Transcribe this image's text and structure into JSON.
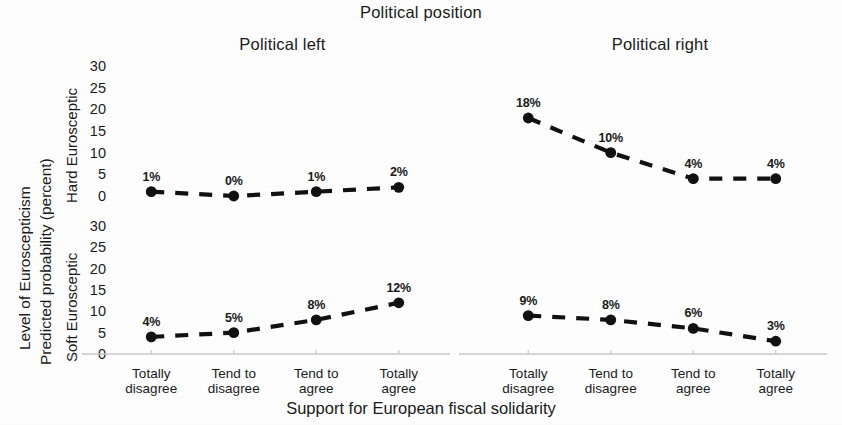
{
  "chart_data": {
    "type": "line",
    "title": "Political position",
    "xlabel": "Support for European fiscal solidarity",
    "ylabel_outer": "Level of Euroscepticism",
    "ylabel_inner": "Predicted probability (percent)",
    "categories": [
      "Totally disagree",
      "Tend to disagree",
      "Tend to agree",
      "Totally agree"
    ],
    "ylim": [
      0,
      30
    ],
    "yticks": [
      0,
      5,
      10,
      15,
      20,
      25,
      30
    ],
    "grid": false,
    "legend": "none",
    "line_style": "dashed",
    "marker": "filled-circle",
    "series_color": "#111111",
    "axis_color": "#c8c8c8",
    "panel_columns": [
      "Political left",
      "Political right"
    ],
    "panel_rows": [
      "Hard Eurosceptic",
      "Soft Eurosceptic"
    ],
    "panels": [
      {
        "row": "Hard Eurosceptic",
        "column": "Political left",
        "values": [
          1,
          0,
          1,
          2
        ],
        "labels": [
          "1%",
          "0%",
          "1%",
          "2%"
        ]
      },
      {
        "row": "Hard Eurosceptic",
        "column": "Political right",
        "values": [
          18,
          10,
          4,
          4
        ],
        "labels": [
          "18%",
          "10%",
          "4%",
          "4%"
        ]
      },
      {
        "row": "Soft Eurosceptic",
        "column": "Political left",
        "values": [
          4,
          5,
          8,
          12
        ],
        "labels": [
          "4%",
          "5%",
          "8%",
          "12%"
        ]
      },
      {
        "row": "Soft Eurosceptic",
        "column": "Political right",
        "values": [
          9,
          8,
          6,
          3
        ],
        "labels": [
          "9%",
          "8%",
          "6%",
          "3%"
        ]
      }
    ]
  },
  "titles": {
    "main": "Political position",
    "panel_left": "Political left",
    "panel_right": "Political right",
    "xaxis": "Support for European fiscal solidarity",
    "yaxis_outer": "Level of Euroscepticism",
    "yaxis_inner": "Predicted probability (percent)",
    "row_hard": "Hard Eurosceptic",
    "row_soft": "Soft Eurosceptic"
  },
  "ytick_labels": [
    "30",
    "25",
    "20",
    "15",
    "10",
    "5",
    "0"
  ],
  "categories": [
    {
      "line1": "Totally",
      "line2": "disagree"
    },
    {
      "line1": "Tend to",
      "line2": "disagree"
    },
    {
      "line1": "Tend to",
      "line2": "agree"
    },
    {
      "line1": "Totally",
      "line2": "agree"
    }
  ]
}
